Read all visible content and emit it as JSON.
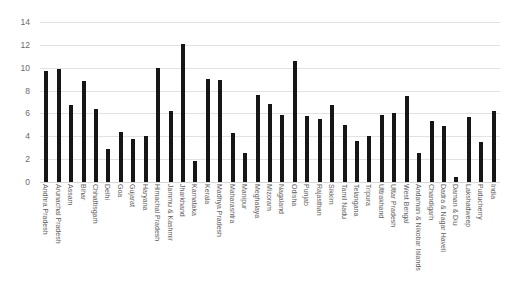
{
  "chart_data": {
    "type": "bar",
    "title": "",
    "subtitle": "",
    "xlabel": "",
    "ylabel": "",
    "ylim": [
      0,
      14
    ],
    "yticks": [
      0,
      2,
      4,
      6,
      8,
      10,
      12,
      14
    ],
    "grid": true,
    "legend": false,
    "legend_position": "none",
    "bar_color": "#161616",
    "gridline_color": "#e2e2e2",
    "axis_text_color": "#5e5e5e",
    "categories": [
      "Andhra Pradesh",
      "Arunachal Pradesh",
      "Assam",
      "Bihar",
      "Chhattisgarh",
      "Delhi",
      "Goa",
      "Gujarat",
      "Haryana",
      "Himachal Pradesh",
      "Jammu & Kashmir",
      "Jharkhand",
      "Karnataka",
      "Kerala",
      "Madhya Pradesh",
      "Maharashtra",
      "Manipur",
      "Meghalaya",
      "Mizoram",
      "Nagaland",
      "Odisha",
      "Punjab",
      "Rajasthan",
      "Sikkim",
      "Tamil Nadu",
      "Telangana",
      "Tripura",
      "Uttrakhand",
      "Uttar Pradesh",
      "West Bengal",
      "Andaman & Nikobar Islands",
      "Chandigarh",
      "Dadra & Nagar Haveli",
      "Daman & Diu",
      "Lakshadweep",
      "Puducherry",
      "India"
    ],
    "values": [
      9.7,
      9.9,
      6.7,
      8.8,
      6.4,
      2.9,
      4.4,
      3.8,
      4.0,
      10.0,
      6.2,
      12.1,
      1.8,
      9.0,
      8.9,
      4.3,
      2.5,
      7.6,
      6.8,
      5.9,
      10.6,
      5.8,
      5.5,
      6.7,
      5.0,
      3.6,
      4.0,
      5.9,
      6.0,
      7.5,
      2.5,
      5.3,
      4.9,
      0.4,
      5.7,
      3.5,
      6.2
    ]
  }
}
